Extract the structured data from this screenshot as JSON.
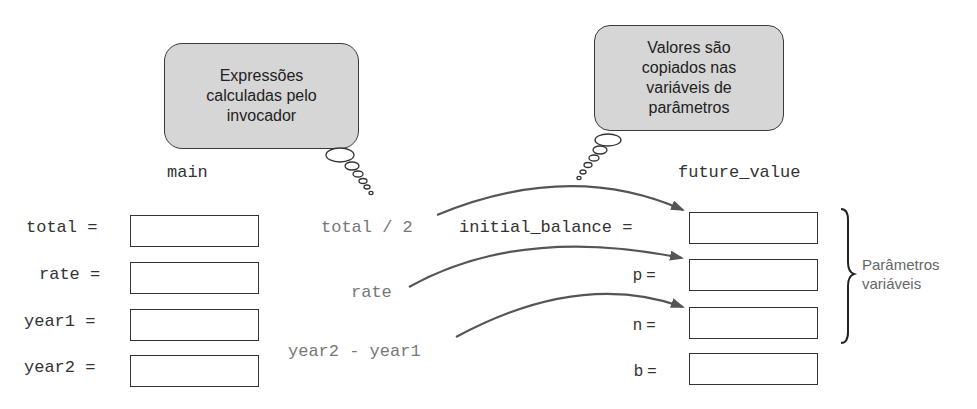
{
  "bubbles": {
    "caller": {
      "lines": [
        "Expressões",
        "calculadas pelo",
        "invocador"
      ]
    },
    "params": {
      "lines": [
        "Valores são",
        "copiados nas",
        "variáveis de",
        "parâmetros"
      ]
    }
  },
  "main": {
    "title": "main",
    "variables": [
      {
        "label": "total ="
      },
      {
        "label": "rate ="
      },
      {
        "label": "year1 ="
      },
      {
        "label": "year2 ="
      }
    ]
  },
  "expressions": [
    {
      "text": "total / 2"
    },
    {
      "text": "rate"
    },
    {
      "text": "year2 - year1"
    }
  ],
  "future_value": {
    "title": "future_value",
    "variables": [
      {
        "label": "initial_balance ="
      },
      {
        "label": "p ="
      },
      {
        "label": "n ="
      },
      {
        "label": "b ="
      }
    ]
  },
  "brace_label": {
    "lines": [
      "Parâmetros",
      "variáveis"
    ]
  },
  "colors": {
    "bubble_fill": "#d6d6d6",
    "arrow": "#555555",
    "expression_text": "#777777"
  }
}
